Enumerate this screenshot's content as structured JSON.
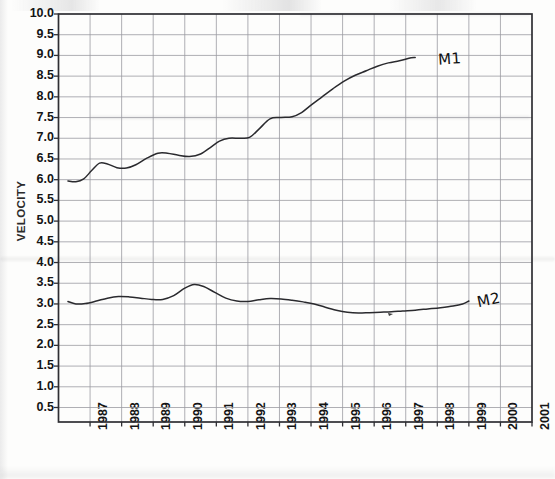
{
  "figure": {
    "caption_fragment_visible": "",
    "background_color": "#fdfdfc",
    "ink_color": "#222222",
    "grid_color": "#8b8b92"
  },
  "axes": {
    "y_title": "VELOCITY",
    "y_ticks": [
      "10.0",
      "9.5",
      "9.0",
      "8.5",
      "8.0",
      "7.5",
      "7.0",
      "6.5",
      "6.0",
      "5.5",
      "5.0",
      "4.5",
      "4.0",
      "3.5",
      "3.0",
      "2.5",
      "2.0",
      "1.5",
      "1.0",
      "0.5"
    ],
    "x_ticks": [
      "1987",
      "1988",
      "1989",
      "1990",
      "1991",
      "1992",
      "1993",
      "1994",
      "1995",
      "1996",
      "1997",
      "1998",
      "1999",
      "2000",
      "2001"
    ]
  },
  "annotations": [
    {
      "name": "m1-label",
      "text": "M1",
      "x": 438,
      "y": 50
    },
    {
      "name": "m2-label",
      "text": "M2",
      "x": 477,
      "y": 291
    }
  ],
  "chart_data": {
    "type": "line",
    "title": "",
    "xlabel": "",
    "ylabel": "VELOCITY",
    "xlim": [
      1986.0,
      2001.0
    ],
    "ylim": [
      0.15,
      10.0
    ],
    "grid": true,
    "legend": "inline-handwritten",
    "x_tick_values": [
      1987,
      1988,
      1989,
      1990,
      1991,
      1992,
      1993,
      1994,
      1995,
      1996,
      1997,
      1998,
      1999,
      2000,
      2001
    ],
    "y_tick_values": [
      0.5,
      1.0,
      1.5,
      2.0,
      2.5,
      3.0,
      3.5,
      4.0,
      4.5,
      5.0,
      5.5,
      6.0,
      6.5,
      7.0,
      7.5,
      8.0,
      8.5,
      9.0,
      9.5,
      10.0
    ],
    "series": [
      {
        "name": "M1",
        "x": [
          1986.3,
          1986.55,
          1986.8,
          1987.05,
          1987.3,
          1987.55,
          1987.85,
          1988.15,
          1988.45,
          1988.8,
          1989.15,
          1989.45,
          1989.8,
          1990.15,
          1990.5,
          1990.85,
          1991.1,
          1991.4,
          1991.75,
          1992.05,
          1992.35,
          1992.7,
          1993.05,
          1993.4,
          1993.7,
          1994.0,
          1994.35,
          1994.7,
          1995.05,
          1995.4,
          1995.75,
          1996.1,
          1996.45,
          1996.8,
          1997.1,
          1997.3
        ],
        "y": [
          5.97,
          5.95,
          6.02,
          6.22,
          6.4,
          6.38,
          6.29,
          6.28,
          6.36,
          6.52,
          6.64,
          6.64,
          6.59,
          6.56,
          6.62,
          6.8,
          6.93,
          7.0,
          7.0,
          7.02,
          7.22,
          7.47,
          7.5,
          7.52,
          7.62,
          7.8,
          8.0,
          8.2,
          8.38,
          8.52,
          8.63,
          8.74,
          8.82,
          8.87,
          8.93,
          8.95
        ]
      },
      {
        "name": "M2",
        "x": [
          1986.3,
          1986.55,
          1986.85,
          1987.2,
          1987.55,
          1987.9,
          1988.25,
          1988.6,
          1988.95,
          1989.3,
          1989.65,
          1990.0,
          1990.3,
          1990.6,
          1990.95,
          1991.3,
          1991.65,
          1992.0,
          1992.35,
          1992.7,
          1993.05,
          1993.4,
          1993.75,
          1994.1,
          1994.45,
          1994.8,
          1995.15,
          1995.5,
          1995.85,
          1996.2,
          1996.55,
          1996.9,
          1997.3,
          1997.7,
          1998.1,
          1998.5,
          1998.8,
          1999.0
        ],
        "y": [
          3.06,
          3.0,
          3.01,
          3.07,
          3.14,
          3.18,
          3.17,
          3.14,
          3.11,
          3.11,
          3.2,
          3.38,
          3.47,
          3.42,
          3.28,
          3.14,
          3.07,
          3.06,
          3.1,
          3.13,
          3.12,
          3.09,
          3.05,
          3.0,
          2.92,
          2.85,
          2.8,
          2.78,
          2.79,
          2.8,
          2.81,
          2.83,
          2.85,
          2.88,
          2.91,
          2.95,
          3.0,
          3.07
        ]
      }
    ]
  }
}
